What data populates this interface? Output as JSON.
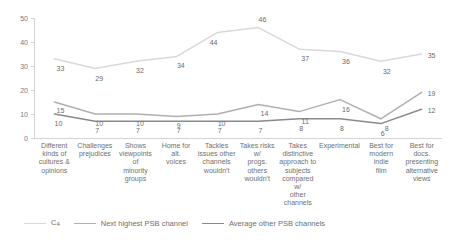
{
  "chart_data": {
    "type": "line",
    "title": "",
    "subtitle": "",
    "xlabel": "",
    "ylabel": "",
    "ylim": [
      0,
      50
    ],
    "yticks": [
      0,
      10,
      20,
      30,
      40,
      50
    ],
    "grid": false,
    "legend_position": "bottom-left",
    "categories": [
      "Different kinds of cultures & opinions",
      "Challenges prejudices",
      "Shows viewpoints of minority groups",
      "Home for alt. voices",
      "Tackles issues other channels wouldn't",
      "Takes risks w/ progs. others wouldn't",
      "Takes distinctive approach to subjects compared w/ other channels",
      "Experimental",
      "Best for modern indie film",
      "Best for docs. presenting alternative views"
    ],
    "category_lines": [
      [
        "Different",
        "kinds of",
        "cultures &",
        "opinions"
      ],
      [
        "Challenges",
        "prejudices"
      ],
      [
        "Shows",
        "viewpoints of",
        "minority",
        "groups"
      ],
      [
        "Home for alt.",
        "voices"
      ],
      [
        "Tackles",
        "issues other",
        "channels",
        "wouldn't"
      ],
      [
        "Takes risks w/",
        "progs. others",
        "wouldn't"
      ],
      [
        "Takes",
        "distinctive",
        "approach to",
        "subjects",
        "compared w/",
        "other",
        "channels"
      ],
      [
        "Experimental"
      ],
      [
        "Best for",
        "modern indie",
        "film"
      ],
      [
        "Best for docs.",
        "presenting",
        "alternative",
        "views"
      ]
    ],
    "series": [
      {
        "name": "C4",
        "legend_label": "C4",
        "color": "#d9d9d9",
        "values": [
          33,
          29,
          32,
          34,
          44,
          46,
          37,
          36,
          32,
          35
        ]
      },
      {
        "name": "Next highest PSB channel",
        "legend_label": "Next highest PSB channel",
        "color": "#b0b0b0",
        "values": [
          15,
          10,
          10,
          9,
          10,
          14,
          11,
          16,
          8,
          19
        ]
      },
      {
        "name": "Average other PSB channels",
        "legend_label": "Average other PSB channels",
        "color": "#8a8a8a",
        "values": [
          10,
          7,
          7,
          7,
          7,
          7,
          8,
          8,
          6,
          12
        ]
      }
    ],
    "label_offsets": {
      "C4": [
        [
          6,
          9
        ],
        [
          4,
          10
        ],
        [
          4,
          9
        ],
        [
          4,
          9
        ],
        [
          -4,
          10
        ],
        [
          4,
          -9
        ],
        [
          6,
          9
        ],
        [
          6,
          9
        ],
        [
          6,
          10
        ],
        [
          10,
          1
        ]
      ],
      "Next highest PSB channel": [
        [
          6,
          8
        ],
        [
          4,
          9
        ],
        [
          4,
          9
        ],
        [
          2,
          9
        ],
        [
          4,
          9
        ],
        [
          6,
          9
        ],
        [
          6,
          9
        ],
        [
          6,
          9
        ],
        [
          6,
          9
        ],
        [
          10,
          1
        ]
      ],
      "Average other PSB channels": [
        [
          4,
          9
        ],
        [
          2,
          9
        ],
        [
          2,
          9
        ],
        [
          2,
          9
        ],
        [
          2,
          9
        ],
        [
          2,
          9
        ],
        [
          2,
          9
        ],
        [
          2,
          9
        ],
        [
          2,
          9
        ],
        [
          10,
          1
        ]
      ]
    }
  }
}
